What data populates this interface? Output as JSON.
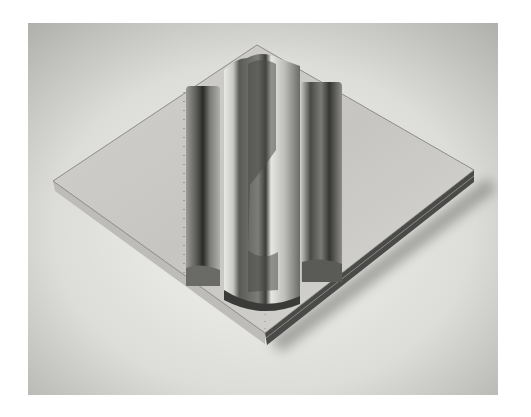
{
  "image": {
    "subject": "black-and-white photograph of a sculpture: a square diamond-oriented plinth with three vertical metallic cylindrical forms",
    "frame": {
      "x": 28,
      "y": 23,
      "width": 470,
      "height": 372
    },
    "colors": {
      "page": "#ffffff",
      "backdrop_light": "#ebebe9",
      "backdrop_dark": "#b9b9b6",
      "plinth_top": "#c9c8c4",
      "plinth_edge": "#4a4a48",
      "metal_dark": "#3a3a38",
      "metal_mid": "#8a8a86",
      "metal_light": "#e4e4e0"
    },
    "plinth": {
      "top": [
        257,
        45
      ],
      "right": [
        474,
        170
      ],
      "bottom": [
        265,
        333
      ],
      "left": [
        53,
        181
      ]
    }
  }
}
